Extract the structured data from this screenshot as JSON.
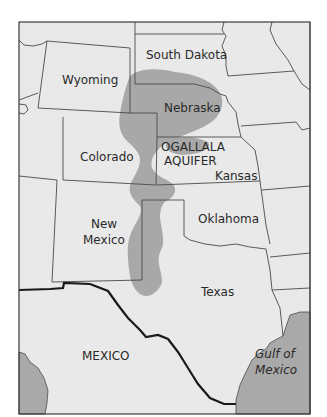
{
  "map": {
    "title": "Ogallala Aquifer region map",
    "colors": {
      "land": "#e9e9e9",
      "aquifer": "#a8a8a8",
      "water": "#a9a9a9",
      "border": "#4a4a4a",
      "national_border": "#1a1a1a",
      "frame": "#3a3a3a",
      "background": "#ffffff"
    },
    "labels": {
      "wyoming": "Wyoming",
      "south_dakota": "South Dakota",
      "nebraska": "Nebraska",
      "colorado": "Colorado",
      "aquifer_line1": "OGALLALA",
      "aquifer_line2": "AQUIFER",
      "kansas": "Kansas",
      "new_mexico_line1": "New",
      "new_mexico_line2": "Mexico",
      "oklahoma": "Oklahoma",
      "texas": "Texas",
      "mexico": "MEXICO",
      "gulf_line1": "Gulf of",
      "gulf_line2": "Mexico"
    }
  }
}
